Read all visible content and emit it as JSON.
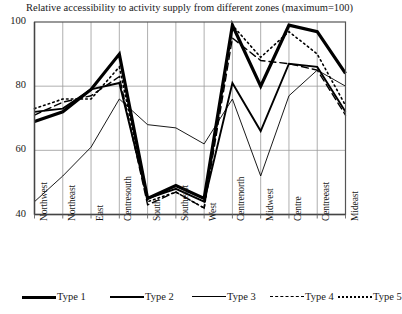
{
  "chart_data": {
    "type": "line",
    "title": "Relative accessibility to activity supply from different zones (maximum=100)",
    "xlabel": "",
    "ylabel": "",
    "ylim": [
      40,
      100
    ],
    "yticks": [
      40,
      60,
      80,
      100
    ],
    "grid": true,
    "legend_position": "bottom",
    "categories": [
      "Northwest",
      "Northeast",
      "East",
      "Centresouth",
      "South",
      "Southeast",
      "West",
      "Centrenorth",
      "Midwest",
      "Centre",
      "Centreeast",
      "Mideast"
    ],
    "series": [
      {
        "name": "Type 1",
        "style": "solid",
        "width": 3.2,
        "color": "#000000",
        "values": [
          69,
          72,
          79,
          90,
          45,
          49,
          45,
          99,
          80,
          99,
          97,
          84
        ]
      },
      {
        "name": "Type 2",
        "style": "solid",
        "width": 1.9,
        "color": "#000000",
        "values": [
          72,
          73,
          79,
          81,
          45,
          48,
          44,
          81,
          66,
          87,
          86,
          72
        ]
      },
      {
        "name": "Type 3",
        "style": "solid",
        "width": 0.9,
        "color": "#000000",
        "values": [
          44,
          52,
          61,
          76,
          68,
          67,
          62,
          76,
          52,
          77,
          85,
          80
        ]
      },
      {
        "name": "Type 4",
        "style": "dashed",
        "width": 1.4,
        "color": "#000000",
        "values": [
          71,
          75,
          77,
          83,
          43,
          47,
          42,
          95,
          88,
          87,
          85,
          71
        ]
      },
      {
        "name": "Type 5",
        "style": "dotted",
        "width": 1.6,
        "color": "#000000",
        "values": [
          73,
          76,
          76,
          86,
          44,
          47,
          42,
          99,
          89,
          97,
          90,
          74
        ]
      }
    ]
  },
  "legend": {
    "entries": [
      {
        "label": "Type 1"
      },
      {
        "label": "Type 2"
      },
      {
        "label": "Type 3"
      },
      {
        "label": "Type 4"
      },
      {
        "label": "Type 5"
      }
    ]
  }
}
